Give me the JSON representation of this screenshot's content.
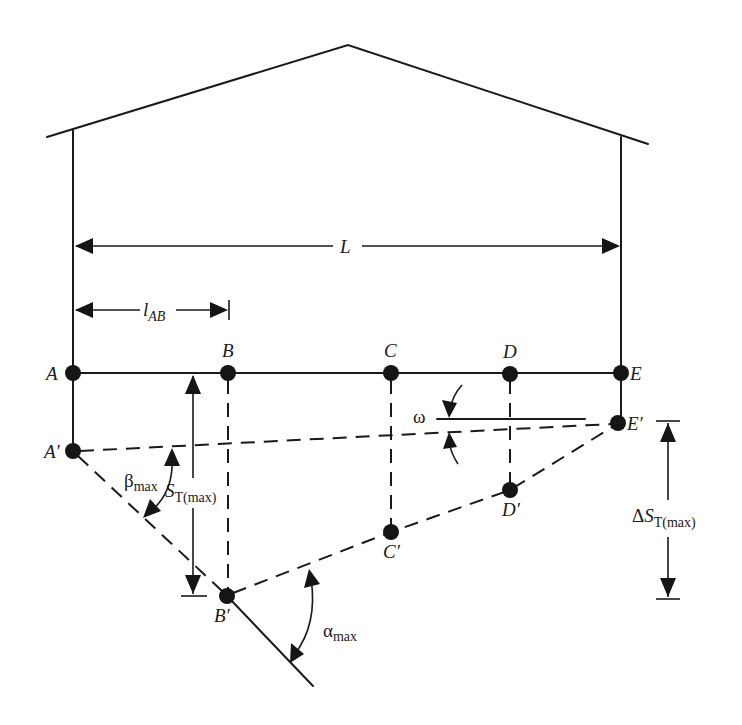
{
  "diagram": {
    "type": "building-settlement-schematic",
    "colors": {
      "ink": "#1a1a1a",
      "background": "#ffffff"
    },
    "labels": {
      "span_total": "L",
      "span_ab_main": "l",
      "span_ab_sub": "AB",
      "point_a": "A",
      "point_b": "B",
      "point_c": "C",
      "point_d": "D",
      "point_e": "E",
      "point_a_prime": "A′",
      "point_b_prime": "B′",
      "point_c_prime": "C′",
      "point_d_prime": "D′",
      "point_e_prime": "E′",
      "tilt": "ω",
      "beta_main": "β",
      "beta_sub": "max",
      "alpha_main": "α",
      "alpha_sub": "max",
      "settlement_main": "S",
      "settlement_sub": "T(max)",
      "diff_settlement_delta": "Δ",
      "diff_settlement_main": "S",
      "diff_settlement_sub": "T(max)"
    },
    "points": {
      "original": [
        "A",
        "B",
        "C",
        "D",
        "E"
      ],
      "settled": [
        "A′",
        "B′",
        "C′",
        "D′",
        "E′"
      ]
    },
    "dimensions": [
      {
        "name": "L",
        "from": "A",
        "to": "E",
        "orientation": "horizontal"
      },
      {
        "name": "l_AB",
        "from": "A",
        "to": "B",
        "orientation": "horizontal"
      },
      {
        "name": "S_T(max)",
        "from": "B",
        "to": "B′",
        "orientation": "vertical"
      },
      {
        "name": "ΔS_T(max)",
        "from": "E′",
        "to": "B′",
        "orientation": "vertical"
      }
    ],
    "angles": [
      {
        "name": "β_max",
        "between": [
          "A′E′",
          "A′B′"
        ]
      },
      {
        "name": "α_max",
        "between": [
          "B′E′",
          "A′B′ extended"
        ]
      },
      {
        "name": "ω",
        "between": [
          "horizontal",
          "A′E′"
        ]
      }
    ]
  }
}
